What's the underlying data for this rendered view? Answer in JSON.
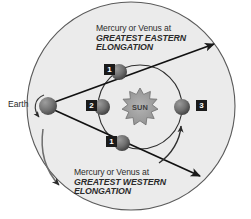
{
  "diagram": {
    "background_color": "#ffffff",
    "orbit_fill_color": "#ebebeb",
    "line_color": "#1a1a1a",
    "sun_color": "#8c8c8c",
    "planet_color": "#6e6e6e",
    "earth_color": "#6e6e6e"
  },
  "labels": {
    "earth": "Earth",
    "sun": "SUN",
    "eastern_line1": "Mercury or Venus at",
    "eastern_line2": "GREATEST EASTERN",
    "eastern_line3": "ELONGATION",
    "western_line1": "Mercury or Venus at",
    "western_line2": "GREATEST WESTERN",
    "western_line3": "ELONGATION"
  },
  "markers": [
    {
      "id": "marker-1-upper",
      "number": "1",
      "x": 104,
      "y": 64,
      "role": "greatest-eastern-elongation-position"
    },
    {
      "id": "marker-2",
      "number": "2",
      "x": 86,
      "y": 100,
      "role": "inferior-conjunction-position"
    },
    {
      "id": "marker-3",
      "number": "3",
      "x": 196,
      "y": 100,
      "role": "superior-conjunction-position"
    },
    {
      "id": "marker-1-lower",
      "number": "1",
      "x": 106,
      "y": 136,
      "role": "greatest-western-elongation-position"
    }
  ],
  "bodies": {
    "earth": {
      "cx": 48,
      "cy": 106,
      "r": 9
    },
    "sun": {
      "cx": 140,
      "cy": 107,
      "r": 17
    },
    "planets": [
      {
        "name": "planet-upper-elongation",
        "cx": 119,
        "cy": 72,
        "r": 8
      },
      {
        "name": "planet-inferior-conjunction",
        "cx": 102,
        "cy": 107,
        "r": 8
      },
      {
        "name": "planet-superior-conjunction",
        "cx": 182,
        "cy": 107,
        "r": 8
      },
      {
        "name": "planet-lower-elongation",
        "cx": 122,
        "cy": 143,
        "r": 8
      }
    ]
  },
  "orbits": {
    "earth_orbit": {
      "cx": 131,
      "cy": 106,
      "r": 105,
      "note": "outer orbit arc of Earth"
    },
    "inner_orbit": {
      "cx": 140,
      "cy": 107,
      "r": 42,
      "note": "orbit of Mercury or Venus"
    }
  }
}
